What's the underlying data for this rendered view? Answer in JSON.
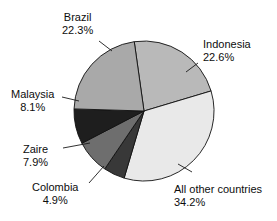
{
  "chart_data": {
    "type": "pie",
    "title": "",
    "subtitle": "",
    "xlabel": "",
    "ylabel": "",
    "legend_position": "none",
    "grid": false,
    "units": "percent",
    "categories": [
      "Indonesia",
      "All other countries",
      "Colombia",
      "Zaire",
      "Malaysia",
      "Brazil"
    ],
    "values": [
      22.6,
      34.2,
      4.9,
      7.9,
      8.1,
      22.3
    ],
    "slices": [
      {
        "label": "Indonesia",
        "value": 22.6,
        "value_text": "22.6%",
        "color": "#b9b9b9",
        "label_align": "left",
        "label_left": 203,
        "label_top": 38,
        "leader": [
          198,
          63,
          186,
          72
        ]
      },
      {
        "label": "All other countries",
        "value": 34.2,
        "value_text": "34.2%",
        "color": "#e9e9e9",
        "label_align": "left",
        "label_left": 174,
        "label_top": 183,
        "leader": [
          192,
          172,
          178,
          164
        ]
      },
      {
        "label": "Colombia",
        "value": 4.9,
        "value_text": "4.9%",
        "color": "#383838",
        "label_align": "center",
        "label_left": 32,
        "label_top": 181,
        "leader": [
          89,
          183,
          104,
          166
        ]
      },
      {
        "label": "Zaire",
        "value": 7.9,
        "value_text": "7.9%",
        "color": "#6e6e6e",
        "label_align": "center",
        "label_left": 23,
        "label_top": 143,
        "leader": [
          63,
          148,
          90,
          143
        ]
      },
      {
        "label": "Malaysia",
        "value": 8.1,
        "value_text": "8.1%",
        "color": "#1e1e1e",
        "label_align": "center",
        "label_left": 11,
        "label_top": 88,
        "leader": [
          62,
          97,
          79,
          101
        ]
      },
      {
        "label": "Brazil",
        "value": 22.3,
        "value_text": "22.3%",
        "color": "#a9a9a9",
        "label_align": "center",
        "label_left": 62,
        "label_top": 11,
        "leader": [
          99,
          41,
          112,
          51
        ]
      }
    ],
    "geometry": {
      "center_x": 144,
      "center_y": 111,
      "radius": 70,
      "start_angle_deg": -98
    },
    "colors": {
      "outline": "#111111",
      "text": "#0d0d0d",
      "background": "#ffffff"
    }
  }
}
